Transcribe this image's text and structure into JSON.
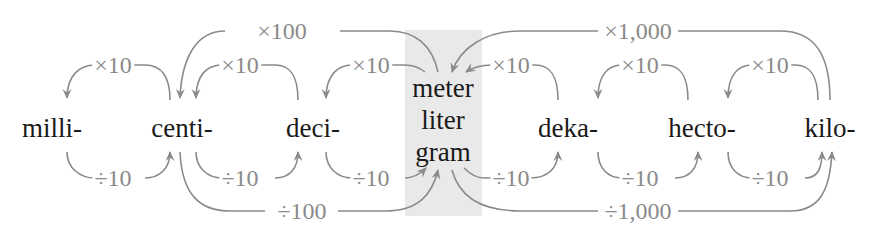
{
  "colors": {
    "arrow": "#8a8a8a",
    "text": "#1a1a1a",
    "band": "#e9e9e9"
  },
  "units": {
    "milli": "milli-",
    "centi": "centi-",
    "deci": "deci-",
    "base": [
      "meter",
      "liter",
      "gram"
    ],
    "deka": "deka-",
    "hecto": "hecto-",
    "kilo": "kilo-"
  },
  "operators": {
    "times100": "×100",
    "times1000": "×1,000",
    "div100": "÷100",
    "div1000": "÷1,000",
    "times10": [
      "×10",
      "×10",
      "×10",
      "×10",
      "×10",
      "×10"
    ],
    "div10": [
      "÷10",
      "÷10",
      "÷10",
      "÷10",
      "÷10",
      "÷10"
    ]
  }
}
